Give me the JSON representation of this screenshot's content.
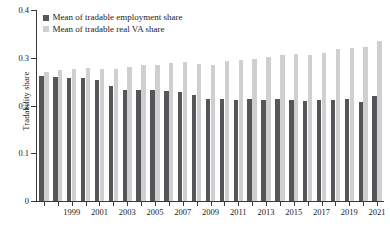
{
  "chart_data": {
    "type": "bar",
    "title": "",
    "xlabel": "",
    "ylabel": "Tradability share",
    "ylim": [
      0,
      0.4
    ],
    "yticks": [
      "0",
      "0.1",
      "0.2",
      "0.3",
      "0.4"
    ],
    "ytick_values": [
      0,
      0.1,
      0.2,
      0.3,
      0.4
    ],
    "grid": false,
    "legend_position": "top-left",
    "categories": [
      "1997",
      "1998",
      "1999",
      "2000",
      "2001",
      "2002",
      "2003",
      "2004",
      "2005",
      "2006",
      "2007",
      "2008",
      "2009",
      "2010",
      "2011",
      "2012",
      "2013",
      "2014",
      "2015",
      "2016",
      "2017",
      "2018",
      "2019",
      "2020",
      "2021"
    ],
    "xtick_labels": [
      "1999",
      "2001",
      "2003",
      "2005",
      "2007",
      "2009",
      "2011",
      "2013",
      "2015",
      "2017",
      "2019",
      "2021"
    ],
    "series": [
      {
        "name": "Mean of tradable employment share",
        "color": "#55555a",
        "values": [
          0.261,
          0.259,
          0.258,
          0.257,
          0.254,
          0.24,
          0.233,
          0.233,
          0.232,
          0.23,
          0.228,
          0.221,
          0.213,
          0.213,
          0.212,
          0.213,
          0.212,
          0.214,
          0.212,
          0.21,
          0.211,
          0.212,
          0.213,
          0.208,
          0.219
        ]
      },
      {
        "name": "Mean of tradable real VA share",
        "color": "#cfcfcf",
        "values": [
          0.27,
          0.274,
          0.276,
          0.279,
          0.276,
          0.276,
          0.281,
          0.285,
          0.284,
          0.288,
          0.291,
          0.287,
          0.285,
          0.294,
          0.295,
          0.297,
          0.301,
          0.306,
          0.307,
          0.306,
          0.311,
          0.318,
          0.32,
          0.322,
          0.335
        ]
      }
    ]
  }
}
